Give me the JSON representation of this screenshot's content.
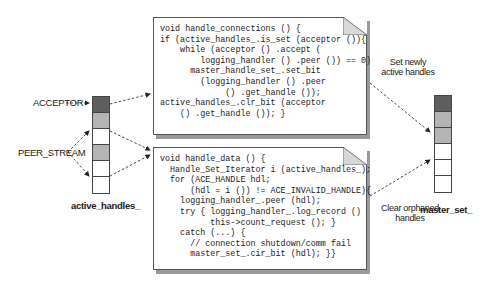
{
  "diagram": {
    "top_box": {
      "function": "handle_connections",
      "code": "void handle_connections () {\nif (active_handles_.is_set (acceptor ()){\n    while (acceptor () .accept (\n        logging_handler () .peer ()) == 0)\n      master_handle_set_.set_bit\n        (logging_handler () .peer\n             () .get_handle ());\nactive_handles_.clr_bit (acceptor\n    () .get_handle ()); }"
    },
    "bottom_box": {
      "function": "handle_data",
      "code": "void handle_data () {\n  Handle_Set_Iterator i (active_handles_);\n  for (ACE_HANDLE hdl;\n      (hdl = i ()) != ACE_INVALID_HANDLE){\n    logging_handler_.peer (hdl);\n    try { logging_handler_.log_record ()\n          this->count_request (); }\n    catch (...) {\n      // connection shutdown/comm fail\n      master_set_.cir_bit (hdl); }}"
    },
    "left_stack": {
      "label": "active_handles_",
      "cells": [
        "#5e5e5e",
        "#b4b4b4",
        "#ffffff",
        "#b4b4b4",
        "#ffffff",
        "#ffffff"
      ]
    },
    "right_stack": {
      "label": "master_set_",
      "cells": [
        "#5e5e5e",
        "#b4b4b4",
        "#b4b4b4",
        "#ffffff",
        "#ffffff",
        "#ffffff"
      ]
    },
    "labels": {
      "acceptor": "ACCEPTOR",
      "peer_stream": "PEER_STREAM"
    },
    "notes": {
      "set_newly_line1": "Set newly",
      "set_newly_line2": "active handles",
      "clear_orphaned_line1": "Clear orphaned",
      "clear_orphaned_line2": "handles"
    }
  }
}
